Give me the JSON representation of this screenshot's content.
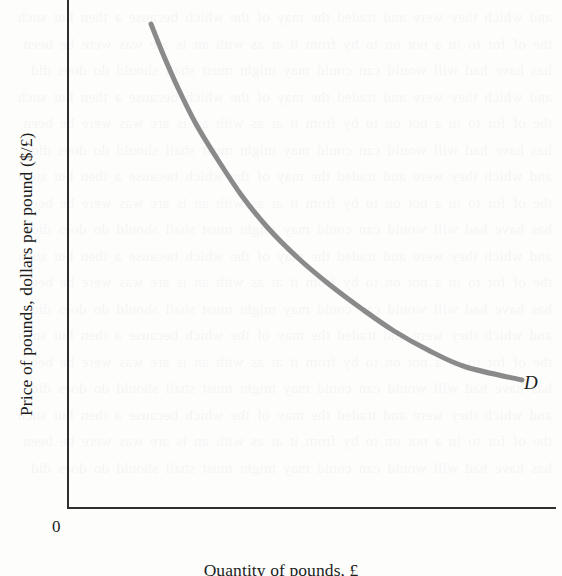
{
  "figure": {
    "origin_label": "0",
    "curve_label": "D",
    "bleed_text": "and which they were and traded the may of the which because a then but such the of for to in a not on to by from it at as with an is are was were be been has have had will would can could may might must shall should do does did and which they were and traded the may of the which because a then but such the of for to in a not on to by from it at as with an is are was were be been has have had will would can could may might must shall should do does did and which they were and traded the may of the which because a then but such the of for to in a not on to by from it at as with an is are was were be been has have had will would can could may might must shall should do does did and which they were and traded the may of the which because a then but such the of for to in a not on to by from it at as with an is are was were be been has have had will would can could may might must shall should do does did and which they were and traded the may of the which because a then but such the of for to in a not on to by from it at as with an is are was were be been has have had will would can could may might must shall should do does did and which they were and traded the may of the which because a then but such the of for to in a not on to by from it at as with an is are was were be been has have had will would can could may might must shall should do does did"
  },
  "chart_data": {
    "type": "line",
    "title": "",
    "subtitle": "",
    "xlabel": "Quantity of pounds, £",
    "ylabel": "Price of pounds, dollars per pound ($/£)",
    "legend": [
      "D"
    ],
    "legend_position": "inline-right-end",
    "grid": false,
    "axis_ticks": [],
    "tick_labels": [],
    "xlim": [
      0,
      100
    ],
    "ylim": [
      0,
      100
    ],
    "annotations": [
      {
        "text": "0",
        "role": "origin"
      },
      {
        "text": "D",
        "role": "curve-label"
      }
    ],
    "series": [
      {
        "name": "D",
        "description": "Downward-sloping demand curve for pounds, convex to the origin",
        "color": "#8a8a8a",
        "linewidth": 5,
        "x": [
          17,
          20,
          24,
          28,
          33,
          38,
          44,
          50,
          57,
          64,
          71,
          78,
          86,
          93
        ],
        "y": [
          95,
          89,
          82,
          75,
          68,
          62,
          56,
          50,
          45,
          40,
          35,
          31,
          28,
          25
        ],
        "pixel_points": [
          [
            151,
            24
          ],
          [
            163,
            54
          ],
          [
            178,
            88
          ],
          [
            196,
            124
          ],
          [
            218,
            160
          ],
          [
            242,
            196
          ],
          [
            268,
            228
          ],
          [
            298,
            258
          ],
          [
            330,
            285
          ],
          [
            362,
            309
          ],
          [
            394,
            331
          ],
          [
            428,
            350
          ],
          [
            466,
            367
          ],
          [
            522,
            380
          ]
        ]
      }
    ]
  }
}
